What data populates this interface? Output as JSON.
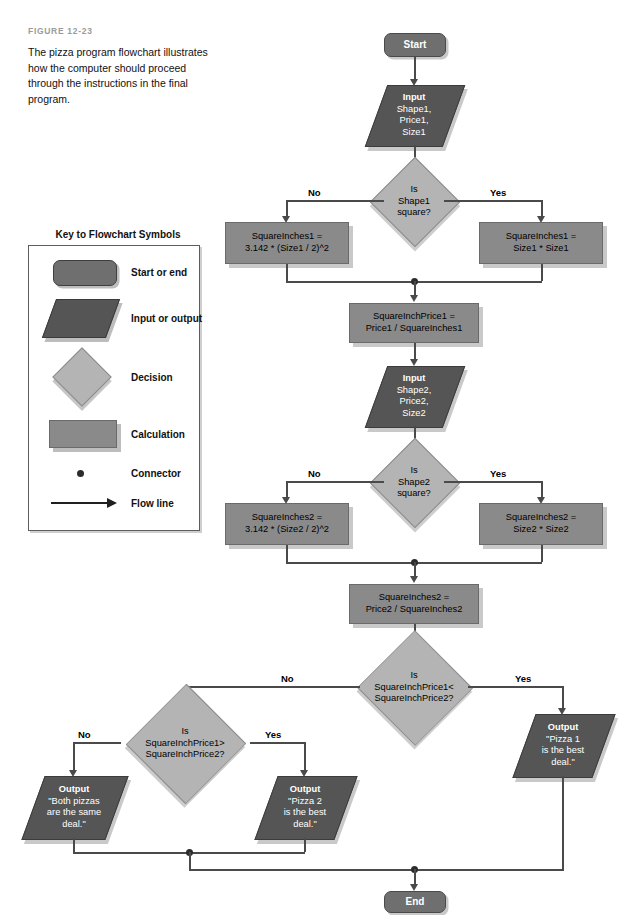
{
  "figure": {
    "label": "FIGURE 12-23",
    "caption": "The pizza program flowchart illustrates how the computer should proceed through the instructions in the final program."
  },
  "key": {
    "title": "Key to Flowchart Symbols",
    "items": [
      {
        "symbol": "terminator",
        "label": "Start or end"
      },
      {
        "symbol": "parallelogram",
        "label": "Input or output"
      },
      {
        "symbol": "diamond",
        "label": "Decision"
      },
      {
        "symbol": "rectangle",
        "label": "Calculation"
      },
      {
        "symbol": "dot",
        "label": "Connector"
      },
      {
        "symbol": "arrow",
        "label": "Flow line"
      }
    ]
  },
  "flowchart": {
    "start": {
      "text": "Start"
    },
    "end": {
      "text": "End"
    },
    "input1": {
      "head": "Input",
      "lines": [
        "Shape1,",
        "Price1,",
        "Size1"
      ]
    },
    "decision1": {
      "lines": [
        "Is",
        "Shape1",
        "square?"
      ]
    },
    "calc1_no": {
      "lines": [
        "SquareInches1 =",
        "3.142 * (Size1 / 2)^2"
      ]
    },
    "calc1_yes": {
      "lines": [
        "SquareInches1 =",
        "Size1 * Size1"
      ]
    },
    "calc_price1": {
      "lines": [
        "SquareInchPrice1 =",
        "Price1 / SquareInches1"
      ]
    },
    "input2": {
      "head": "Input",
      "lines": [
        "Shape2,",
        "Price2,",
        "Size2"
      ]
    },
    "decision2": {
      "lines": [
        "Is",
        "Shape2",
        "square?"
      ]
    },
    "calc2_no": {
      "lines": [
        "SquareInches2 =",
        "3.142 * (Size2 / 2)^2"
      ]
    },
    "calc2_yes": {
      "lines": [
        "SquareInches2 =",
        "Size2 * Size2"
      ]
    },
    "calc_price2": {
      "lines": [
        "SquareInches2 =",
        "Price2 / SquareInches2"
      ]
    },
    "decision3": {
      "lines": [
        "Is",
        "SquareInchPrice1<",
        "SquareInchPrice2?"
      ]
    },
    "decision4": {
      "lines": [
        "Is",
        "SquareInchPrice1>",
        "SquareInchPrice2?"
      ]
    },
    "output_pizza1": {
      "head": "Output",
      "lines": [
        "\"Pizza 1",
        "is the best",
        "deal.\""
      ]
    },
    "output_pizza2": {
      "head": "Output",
      "lines": [
        "\"Pizza 2",
        "is the best",
        "deal.\""
      ]
    },
    "output_same": {
      "head": "Output",
      "lines": [
        "\"Both pizzas",
        "are the same",
        "deal.\""
      ]
    },
    "edges": {
      "d1_no": "No",
      "d1_yes": "Yes",
      "d2_no": "No",
      "d2_yes": "Yes",
      "d3_no": "No",
      "d3_yes": "Yes",
      "d4_no": "No",
      "d4_yes": "Yes"
    }
  },
  "colors": {
    "terminator": "#6f6f6f",
    "io": "#555555",
    "calculation": "#8a8a8a",
    "decision": "#b4b4b4",
    "line": "#4a4a4a",
    "shadow": "#c9c9c9",
    "figure_label": "#9b9b9b"
  }
}
